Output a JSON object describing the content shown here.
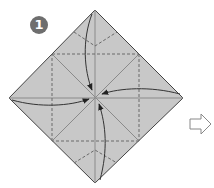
{
  "step": {
    "number": "1",
    "badge_color": "#6e6e6e",
    "badge_text_color": "#ffffff"
  },
  "diagram": {
    "paper_color": "#c8c8c8",
    "outline_color": "#444444",
    "valley_line_color": "#6a6a6a",
    "crease_color": "#8a8a8a",
    "arrow_color": "#333333",
    "corners": {
      "top": [
        95,
        10
      ],
      "left": [
        9,
        98
      ],
      "right": [
        183,
        98
      ],
      "bottom": [
        95,
        183
      ]
    },
    "center": [
      96,
      97
    ],
    "instruction": "Fold all four corners to the center"
  },
  "next_arrow": {
    "icon": "hollow-right-arrow",
    "color": "#ffffff",
    "stroke": "#888888"
  }
}
